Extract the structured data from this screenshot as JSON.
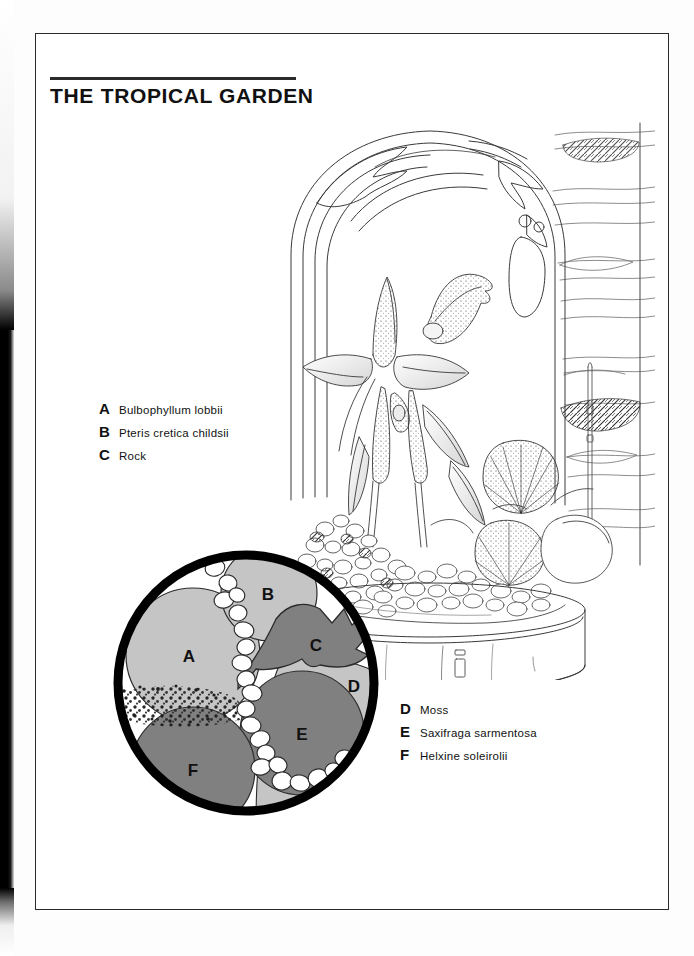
{
  "page": {
    "title_words": [
      "THE",
      "TROPICAL",
      "GARDEN"
    ]
  },
  "legend_left": {
    "name": "upper-plant-key",
    "items": [
      {
        "key": "A",
        "label": "Bulbophyllum  lobbii"
      },
      {
        "key": "B",
        "label": "Pteris cretica childsii"
      },
      {
        "key": "C",
        "label": "Rock"
      }
    ]
  },
  "legend_right": {
    "name": "ground-cover-key",
    "items": [
      {
        "key": "D",
        "label": "Moss"
      },
      {
        "key": "E",
        "label": "Saxifraga  sarmentosa"
      },
      {
        "key": "F",
        "label": "Helxine  soleirolii"
      }
    ]
  },
  "illustration": {
    "name": "bell-jar-terrarium-pen-and-ink",
    "subject": "glass bell jar terrarium with orchid on a cylindrical planter",
    "elements": [
      "bell-jar-dome",
      "orchid-bulbophyllum-lobbii",
      "fern-pteris-cretica",
      "rock",
      "saxifraga-leaves",
      "pebble-gravel-bed",
      "cylindrical-pot",
      "background-shelf-lines"
    ]
  },
  "detail_circle": {
    "name": "planting-plan-detail",
    "regions": [
      {
        "key": "A",
        "tone": "light",
        "x": 83,
        "y": 112
      },
      {
        "key": "B",
        "tone": "light",
        "x": 162,
        "y": 50
      },
      {
        "key": "C",
        "tone": "dark",
        "x": 210,
        "y": 101
      },
      {
        "key": "D",
        "tone": "light",
        "x": 248,
        "y": 142
      },
      {
        "key": "E",
        "tone": "dark",
        "x": 196,
        "y": 190
      },
      {
        "key": "F",
        "tone": "dark",
        "x": 87,
        "y": 226
      }
    ]
  },
  "colors": {
    "ink": "#111111",
    "frame": "#2b2b2b",
    "paper": "#ffffff",
    "tone_light": "#c5c5c5",
    "tone_dark": "#808080",
    "ring": "#000000"
  }
}
